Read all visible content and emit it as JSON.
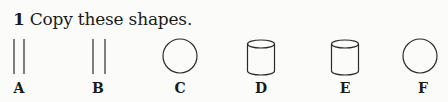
{
  "exercise": {
    "number": "1",
    "instruction": "Copy these shapes."
  },
  "shapes": [
    {
      "label": "A",
      "type": "two-parallel-lines"
    },
    {
      "label": "B",
      "type": "two-parallel-lines"
    },
    {
      "label": "C",
      "type": "circle"
    },
    {
      "label": "D",
      "type": "cylinder"
    },
    {
      "label": "E",
      "type": "cylinder"
    },
    {
      "label": "F",
      "type": "circle"
    }
  ]
}
